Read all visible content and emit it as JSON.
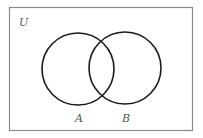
{
  "diagram": {
    "type": "venn",
    "universe_label": "U",
    "sets": [
      {
        "id": "A",
        "label": "A"
      },
      {
        "id": "B",
        "label": "B"
      }
    ],
    "colors": {
      "frame": "#8a8a8a",
      "circle": "#1a1a1a",
      "label": "#555555",
      "background": "#ffffff"
    }
  }
}
